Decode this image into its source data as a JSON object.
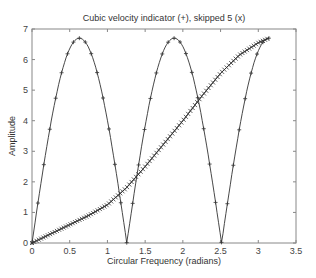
{
  "chart_data": {
    "type": "line",
    "title": "Cubic velocity indicator  (+),  skipped 5 (x)",
    "xlabel": "Circular Frequency  (radians)",
    "ylabel": "Amplitude",
    "xlim": [
      0,
      3.5
    ],
    "ylim": [
      0,
      7
    ],
    "xticks": [
      "0",
      "0.5",
      "1",
      "1.5",
      "2",
      "2.5",
      "3",
      "3.5"
    ],
    "yticks": [
      "0",
      "1",
      "2",
      "3",
      "4",
      "5",
      "6",
      "7"
    ],
    "grid": false,
    "legend": null,
    "series": [
      {
        "name": "Cubic velocity indicator (+)",
        "marker": "+",
        "description": "6.7*|sin(2.5x)|, x from 0 to pi",
        "x": [
          0,
          0.1,
          0.2,
          0.3,
          0.4,
          0.5,
          0.628,
          0.7,
          0.8,
          0.9,
          1.0,
          1.1,
          1.2,
          1.257,
          1.3,
          1.4,
          1.5,
          1.6,
          1.7,
          1.8,
          1.885,
          2.0,
          2.1,
          2.2,
          2.3,
          2.4,
          2.513,
          2.6,
          2.7,
          2.8,
          2.9,
          3.0,
          3.1,
          3.14
        ],
        "y": [
          0,
          1.65,
          3.22,
          4.62,
          5.76,
          6.34,
          6.7,
          6.46,
          6.14,
          5.18,
          4.0,
          2.57,
          0.95,
          0,
          0.72,
          2.28,
          3.77,
          5.09,
          6.12,
          6.62,
          6.7,
          6.46,
          5.66,
          4.41,
          2.89,
          1.28,
          0,
          0.58,
          2.17,
          3.69,
          5.04,
          6.1,
          6.66,
          6.7
        ]
      },
      {
        "name": "skipped 5 (x)",
        "marker": "x",
        "x": [
          0,
          0.25,
          0.5,
          0.75,
          1.0,
          1.25,
          1.5,
          1.75,
          2.0,
          2.25,
          2.5,
          2.75,
          3.0,
          3.14
        ],
        "y": [
          0,
          0.3,
          0.6,
          0.9,
          1.25,
          1.8,
          2.5,
          3.25,
          4.0,
          4.8,
          5.55,
          6.15,
          6.55,
          6.7
        ]
      }
    ]
  }
}
